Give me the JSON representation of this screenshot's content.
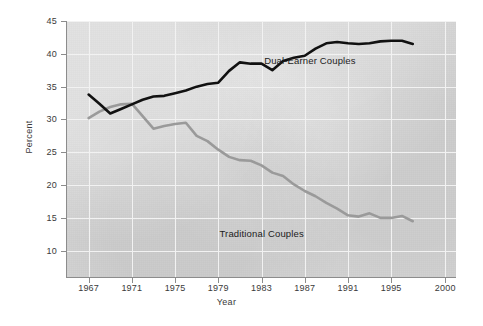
{
  "chart_data": {
    "type": "line",
    "title": "",
    "xlabel": "Year",
    "ylabel": "Percent",
    "xlim": [
      1965,
      2001
    ],
    "ylim": [
      6,
      45
    ],
    "xticks": [
      1967,
      1971,
      1975,
      1979,
      1983,
      1987,
      1991,
      1995,
      2000
    ],
    "yticks": [
      10,
      15,
      20,
      25,
      30,
      35,
      40,
      45
    ],
    "grid": true,
    "legend_position": "inline-annotation",
    "plot_background": "#d6d6d6",
    "series": [
      {
        "name": "Dual-Earner Couples",
        "color": "#111111",
        "label_x": 1987.5,
        "label_y": 38.9,
        "x": [
          1967,
          1968,
          1969,
          1970,
          1971,
          1972,
          1973,
          1974,
          1975,
          1976,
          1977,
          1978,
          1979,
          1980,
          1981,
          1982,
          1983,
          1984,
          1985,
          1986,
          1987,
          1988,
          1989,
          1990,
          1991,
          1992,
          1993,
          1994,
          1995,
          1996,
          1997
        ],
        "values": [
          33.8,
          32.4,
          30.9,
          31.6,
          32.3,
          33.0,
          33.5,
          33.6,
          34.0,
          34.4,
          35.0,
          35.4,
          35.6,
          37.4,
          38.7,
          38.5,
          38.5,
          37.5,
          38.9,
          39.4,
          39.7,
          40.8,
          41.6,
          41.8,
          41.6,
          41.5,
          41.6,
          41.9,
          42.0,
          42.0,
          41.5
        ]
      },
      {
        "name": "Traditional Couples",
        "color": "#9a9a9a",
        "label_x": 1983.0,
        "label_y": 12.5,
        "x": [
          1967,
          1968,
          1969,
          1970,
          1971,
          1972,
          1973,
          1974,
          1975,
          1976,
          1977,
          1978,
          1979,
          1980,
          1981,
          1982,
          1983,
          1984,
          1985,
          1986,
          1987,
          1988,
          1989,
          1990,
          1991,
          1992,
          1993,
          1994,
          1995,
          1996,
          1997
        ],
        "values": [
          30.2,
          31.2,
          31.9,
          32.3,
          32.4,
          30.5,
          28.6,
          29.0,
          29.3,
          29.5,
          27.5,
          26.7,
          25.4,
          24.3,
          23.8,
          23.7,
          23.0,
          21.9,
          21.4,
          20.1,
          19.1,
          18.3,
          17.3,
          16.4,
          15.4,
          15.2,
          15.7,
          15.0,
          15.0,
          15.3,
          14.5
        ]
      }
    ]
  },
  "axis": {
    "y_title": "Percent",
    "x_title": "Year"
  }
}
